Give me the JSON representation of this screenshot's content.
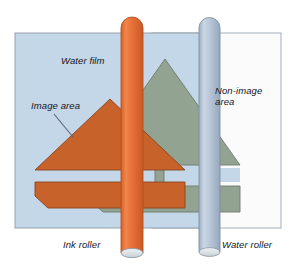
{
  "figure": {
    "labels": {
      "water_film": "Water film",
      "image_area": "Image area",
      "non_image_area": "Non-image\narea",
      "ink_roller": "Ink roller",
      "water_roller": "Water roller"
    },
    "colors": {
      "water_film_panel": "#c3d7e8",
      "non_image_panel": "#fbfbfc",
      "panel_border": "#8d9aa6",
      "image_area_orange": "#c8622b",
      "image_area_orange_edge": "#8a441d",
      "non_image_green": "#93a391",
      "non_image_green_edge": "#6d7c6c",
      "ink_roller": "#e8713a",
      "ink_roller_edge": "#b4501f",
      "water_roller": "#b6c4d6",
      "water_roller_edge": "#7d8ea3",
      "roller_cap": "#dfe5e8",
      "leader_line": "#5a6470",
      "text": "#15151c",
      "page_background": "#ffffff"
    },
    "elements": {
      "water_film_panel": "large light-blue rectangle representing the water film on the plate",
      "non_image_panel": "white rectangle at right representing the non-image area of the plate",
      "image_shape_orange": "orange house/arrow artwork inked by the ink roller",
      "image_shape_green": "grey-green duplicate of the artwork under the water roller",
      "ink_roller_cylinder": "vertical orange cylinder with rounded top and elliptical foot",
      "water_roller_cylinder": "vertical pale blue cylinder with rounded top and elliptical foot",
      "image_area_leader": "diagonal leader line from the Image area label to the orange shape"
    }
  }
}
